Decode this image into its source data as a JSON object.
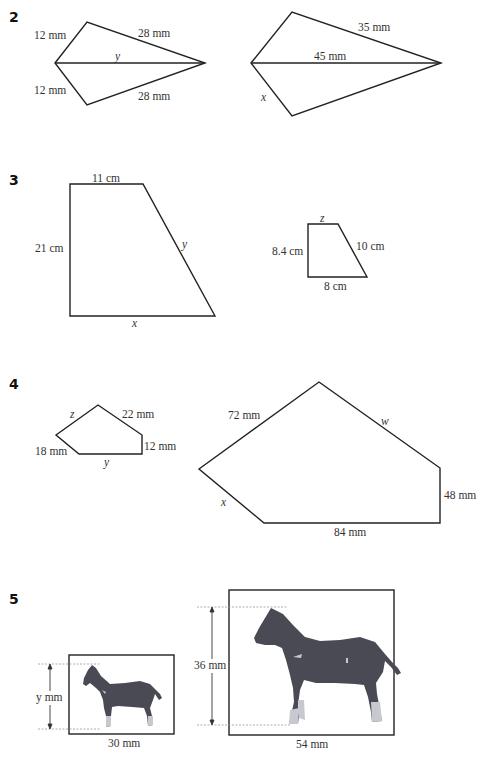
{
  "questions": [
    {
      "number": "2",
      "shapes": [
        {
          "name": "small-kite",
          "labels": [
            "12 mm",
            "28 mm",
            "y",
            "12 mm",
            "28 mm"
          ]
        },
        {
          "name": "large-kite",
          "labels": [
            "35 mm",
            "45 mm",
            "x"
          ]
        }
      ]
    },
    {
      "number": "3",
      "shapes": [
        {
          "name": "large-trapezium",
          "labels": [
            "11 cm",
            "21 cm",
            "y",
            "x"
          ]
        },
        {
          "name": "small-trapezium",
          "labels": [
            "z",
            "8.4 cm",
            "10 cm",
            "8 cm"
          ]
        }
      ]
    },
    {
      "number": "4",
      "shapes": [
        {
          "name": "small-pentagon",
          "labels": [
            "z",
            "22 mm",
            "18 mm",
            "12 mm",
            "y"
          ]
        },
        {
          "name": "large-pentagon",
          "labels": [
            "72 mm",
            "w",
            "x",
            "48 mm",
            "84 mm"
          ]
        }
      ]
    },
    {
      "number": "5",
      "shapes": [
        {
          "name": "small-horse-picture",
          "labels": [
            "y mm",
            "30 mm"
          ]
        },
        {
          "name": "large-horse-picture",
          "labels": [
            "36 mm",
            "54 mm"
          ]
        }
      ]
    }
  ],
  "colors": {
    "line": "#222222",
    "horse": "#4a4a55",
    "horse_highlight": "#c8c8d0",
    "guide": "#999999"
  }
}
